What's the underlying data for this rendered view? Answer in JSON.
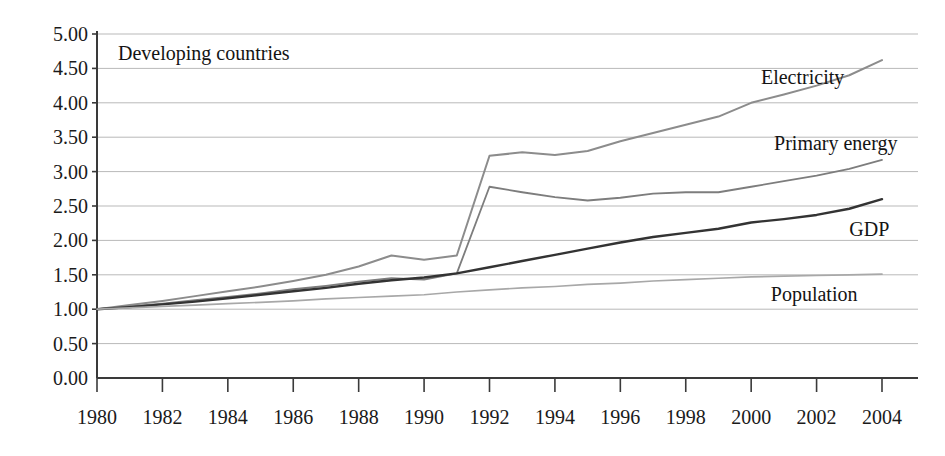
{
  "chart_data": {
    "type": "line",
    "title": "Developing countries",
    "xlabel": "",
    "ylabel": "",
    "xlim": [
      1980,
      2004
    ],
    "ylim": [
      0.0,
      5.0
    ],
    "grid": true,
    "legend_position": "inline-right-of-series",
    "y_ticks": [
      "0.00",
      "0.50",
      "1.00",
      "1.50",
      "2.00",
      "2.50",
      "3.00",
      "3.50",
      "4.00",
      "4.50",
      "5.00"
    ],
    "y_tick_values": [
      0.0,
      0.5,
      1.0,
      1.5,
      2.0,
      2.5,
      3.0,
      3.5,
      4.0,
      4.5,
      5.0
    ],
    "x_ticks": [
      "1980",
      "1982",
      "1984",
      "1986",
      "1988",
      "1990",
      "1992",
      "1994",
      "1996",
      "1998",
      "2000",
      "2002",
      "2004"
    ],
    "x_tick_values": [
      1980,
      1982,
      1984,
      1986,
      1988,
      1990,
      1992,
      1994,
      1996,
      1998,
      2000,
      2002,
      2004
    ],
    "x": [
      1980,
      1981,
      1982,
      1983,
      1984,
      1985,
      1986,
      1987,
      1988,
      1989,
      1990,
      1991,
      1992,
      1993,
      1994,
      1995,
      1996,
      1997,
      1998,
      1999,
      2000,
      2001,
      2002,
      2003,
      2004
    ],
    "series": [
      {
        "name": "Electricity",
        "color": "#8c8c8c",
        "width": 2.0,
        "label_x": 2000.3,
        "label_y": 4.27,
        "values": [
          1.0,
          1.06,
          1.12,
          1.19,
          1.26,
          1.33,
          1.41,
          1.5,
          1.62,
          1.78,
          1.72,
          1.78,
          3.23,
          3.28,
          3.24,
          3.3,
          3.44,
          3.56,
          3.68,
          3.8,
          4.0,
          4.12,
          4.25,
          4.4,
          4.62
        ]
      },
      {
        "name": "Primary energy",
        "color": "#7d7d7d",
        "width": 1.8,
        "label_x": 2000.7,
        "label_y": 3.32,
        "values": [
          1.0,
          1.04,
          1.08,
          1.13,
          1.18,
          1.23,
          1.29,
          1.34,
          1.4,
          1.45,
          1.43,
          1.52,
          2.78,
          2.7,
          2.63,
          2.58,
          2.62,
          2.68,
          2.7,
          2.7,
          2.78,
          2.86,
          2.94,
          3.04,
          3.17
        ]
      },
      {
        "name": "GDP",
        "color": "#333333",
        "width": 2.4,
        "label_x": 2003.0,
        "label_y": 2.06,
        "values": [
          1.0,
          1.03,
          1.07,
          1.11,
          1.16,
          1.21,
          1.26,
          1.31,
          1.37,
          1.42,
          1.46,
          1.52,
          1.61,
          1.7,
          1.79,
          1.88,
          1.97,
          2.05,
          2.11,
          2.17,
          2.26,
          2.31,
          2.37,
          2.46,
          2.6
        ]
      },
      {
        "name": "Population",
        "color": "#a8a8a8",
        "width": 1.7,
        "label_x": 2000.6,
        "label_y": 1.12,
        "values": [
          1.0,
          1.02,
          1.04,
          1.06,
          1.08,
          1.1,
          1.12,
          1.15,
          1.17,
          1.19,
          1.21,
          1.25,
          1.28,
          1.31,
          1.33,
          1.36,
          1.38,
          1.41,
          1.43,
          1.45,
          1.47,
          1.48,
          1.49,
          1.5,
          1.51
        ]
      }
    ]
  },
  "colors": {
    "background": "#ffffff",
    "grid": "#b9b9b9",
    "axis": "#3a3a3a",
    "text": "#141414"
  }
}
